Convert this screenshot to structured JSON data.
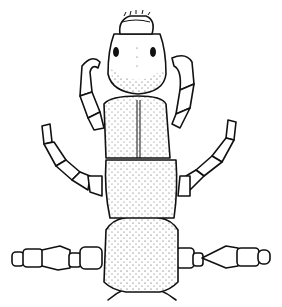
{
  "figure": {
    "background": "#ffffff",
    "ink": "#111111",
    "parts": [
      "head",
      "eyes",
      "labrum",
      "pronotum",
      "mesonotum",
      "metathorax",
      "abdomen-base",
      "forelegs",
      "midlegs",
      "hindlegs"
    ]
  }
}
